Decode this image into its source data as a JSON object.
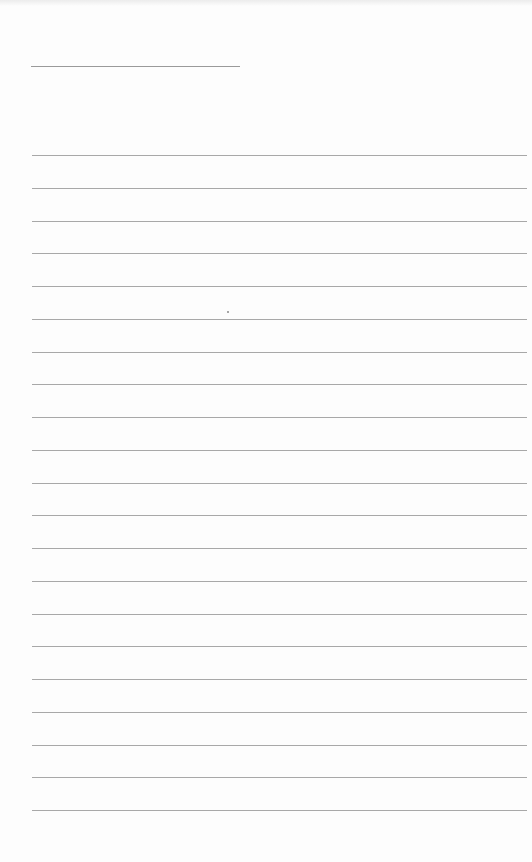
{
  "page": {
    "type": "blank lined paper",
    "background_color": "#fdfdfd",
    "line_color": "#a8a8a8",
    "header_line": {
      "x": 31,
      "y": 66,
      "width": 209
    },
    "ruled_lines": {
      "count": 21,
      "first_y": 155,
      "spacing": 32.75,
      "x": 32,
      "width": 495
    },
    "text": []
  }
}
